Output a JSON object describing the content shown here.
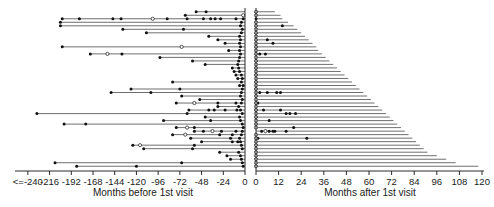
{
  "chart_data": {
    "type": "scatter",
    "title": "",
    "subtitle": "",
    "xlabel_left": "Months before 1st visit",
    "xlabel_right": "Months after 1st visit",
    "ylabel": "",
    "grid": false,
    "legend": null,
    "panels": [
      {
        "name": "before",
        "xlim": [
          -252,
          0
        ],
        "ticks": [
          -240,
          -216,
          -192,
          -168,
          -144,
          -120,
          -96,
          -72,
          -48,
          -24,
          0
        ],
        "tick_labels": [
          "<=-240",
          "-216",
          "-192",
          "-168",
          "-144",
          "-120",
          "-96",
          "-72",
          "-48",
          "-24",
          "0"
        ],
        "axis_title": "Months before 1st visit"
      },
      {
        "name": "after",
        "xlim": [
          0,
          120
        ],
        "ticks": [
          0,
          12,
          24,
          36,
          48,
          60,
          72,
          84,
          96,
          108,
          120
        ],
        "tick_labels": [
          "0",
          "12",
          "24",
          "36",
          "48",
          "60",
          "72",
          "84",
          "96",
          "108",
          "120"
        ],
        "axis_title": "Months after 1st visit"
      }
    ],
    "marker_types": {
      "filled": "filled circle = recorded visit event",
      "open": "open circle = censored / partial event"
    },
    "rows": [
      {
        "id": 1,
        "before_start": -54,
        "before_events": [
          -54,
          -43
        ],
        "before_open": [],
        "after_end": 10,
        "after_events": [],
        "after_open": [
          0
        ]
      },
      {
        "id": 2,
        "before_start": -66,
        "before_events": [
          -66
        ],
        "before_open": [
          -2
        ],
        "after_end": 13,
        "after_events": [],
        "after_open": [
          0
        ]
      },
      {
        "id": 3,
        "before_start": -202,
        "before_events": [
          -202,
          -183,
          -146,
          -137,
          -86,
          -64,
          -46,
          -38,
          -33,
          -27,
          -10,
          -2
        ],
        "before_open": [
          -102
        ],
        "after_end": 14,
        "after_events": [
          0
        ],
        "after_open": []
      },
      {
        "id": 4,
        "before_start": -204,
        "before_events": [
          -204,
          -4
        ],
        "before_open": [],
        "after_end": 17,
        "after_events": [],
        "after_open": [
          0
        ]
      },
      {
        "id": 5,
        "before_start": -204,
        "before_events": [
          -204,
          -5
        ],
        "before_open": [],
        "after_end": 20,
        "after_events": [
          14
        ],
        "after_open": [
          0
        ]
      },
      {
        "id": 6,
        "before_start": -135,
        "before_events": [
          -135,
          -68,
          -3
        ],
        "before_open": [],
        "after_end": 22,
        "after_events": [],
        "after_open": [
          0
        ]
      },
      {
        "id": 7,
        "before_start": -109,
        "before_events": [
          -109,
          -4
        ],
        "before_open": [],
        "after_end": 24,
        "after_events": [],
        "after_open": [
          0
        ]
      },
      {
        "id": 8,
        "before_start": -40,
        "before_events": [
          -40,
          -6
        ],
        "before_open": [],
        "after_end": 26,
        "after_events": [],
        "after_open": [
          0
        ]
      },
      {
        "id": 9,
        "before_start": -30,
        "before_events": [
          -30,
          -5
        ],
        "before_open": [],
        "after_end": 28,
        "after_events": [
          6
        ],
        "after_open": [
          0
        ]
      },
      {
        "id": 10,
        "before_start": -22,
        "before_events": [
          -22,
          -6
        ],
        "before_open": [],
        "after_end": 30,
        "after_events": [
          9
        ],
        "after_open": [
          0
        ]
      },
      {
        "id": 11,
        "before_start": -202,
        "before_events": [
          -202,
          -5
        ],
        "before_open": [
          -70
        ],
        "after_end": 32,
        "after_events": [],
        "after_open": [
          0
        ]
      },
      {
        "id": 12,
        "before_start": -18,
        "before_events": [
          -18,
          -6
        ],
        "before_open": [],
        "after_end": 33,
        "after_events": [],
        "after_open": [
          0
        ]
      },
      {
        "id": 13,
        "before_start": -171,
        "before_events": [
          -171,
          -136,
          -5
        ],
        "before_open": [
          -152
        ],
        "after_end": 35,
        "after_events": [
          2,
          5
        ],
        "after_open": [
          0
        ]
      },
      {
        "id": 14,
        "before_start": -94,
        "before_events": [
          -94,
          -6
        ],
        "before_open": [],
        "after_end": 37,
        "after_events": [],
        "after_open": [
          0
        ]
      },
      {
        "id": 15,
        "before_start": -58,
        "before_events": [
          -58,
          -7
        ],
        "before_open": [],
        "after_end": 39,
        "after_events": [],
        "after_open": [
          0
        ]
      },
      {
        "id": 16,
        "before_start": -44,
        "before_events": [
          -44,
          -8
        ],
        "before_open": [],
        "after_end": 41,
        "after_events": [],
        "after_open": [
          0
        ]
      },
      {
        "id": 17,
        "before_start": -14,
        "before_events": [
          -14,
          -7
        ],
        "before_open": [],
        "after_end": 43,
        "after_events": [],
        "after_open": [
          0
        ]
      },
      {
        "id": 18,
        "before_start": -12,
        "before_events": [
          -12,
          -6
        ],
        "before_open": [],
        "after_end": 45,
        "after_events": [],
        "after_open": [
          0
        ]
      },
      {
        "id": 19,
        "before_start": -10,
        "before_events": [
          -10,
          -4
        ],
        "before_open": [],
        "after_end": 47,
        "after_events": [],
        "after_open": [
          0
        ]
      },
      {
        "id": 20,
        "before_start": -8,
        "before_events": [
          -8,
          -3
        ],
        "before_open": [],
        "after_end": 49,
        "after_events": [],
        "after_open": [
          0
        ]
      },
      {
        "id": 21,
        "before_start": -80,
        "before_events": [
          -80,
          -4
        ],
        "before_open": [],
        "after_end": 51,
        "after_events": [],
        "after_open": [
          0
        ]
      },
      {
        "id": 22,
        "before_start": -6,
        "before_events": [
          -6,
          -2
        ],
        "before_open": [],
        "after_end": 53,
        "after_events": [],
        "after_open": [
          0
        ]
      },
      {
        "id": 23,
        "before_start": -126,
        "before_events": [
          -126,
          -72,
          -3
        ],
        "before_open": [],
        "after_end": 55,
        "after_events": [],
        "after_open": [
          0
        ]
      },
      {
        "id": 24,
        "before_start": -148,
        "before_events": [
          -148,
          -104,
          -4
        ],
        "before_open": [],
        "after_end": 57,
        "after_events": [
          2,
          6,
          11,
          13
        ],
        "after_open": [
          0
        ]
      },
      {
        "id": 25,
        "before_start": -70,
        "before_events": [
          -70,
          -5
        ],
        "before_open": [],
        "after_end": 59,
        "after_events": [],
        "after_open": [
          0
        ]
      },
      {
        "id": 26,
        "before_start": -50,
        "before_events": [
          -50,
          -3
        ],
        "before_open": [],
        "after_end": 61,
        "after_events": [],
        "after_open": [
          0
        ]
      },
      {
        "id": 27,
        "before_start": -76,
        "before_events": [
          -76,
          -30,
          -10,
          -4
        ],
        "before_open": [
          -56
        ],
        "after_end": 63,
        "after_events": [
          1
        ],
        "after_open": [
          0
        ]
      },
      {
        "id": 28,
        "before_start": -30,
        "before_events": [
          -30,
          -7
        ],
        "before_open": [],
        "after_end": 65,
        "after_events": [],
        "after_open": [
          0
        ]
      },
      {
        "id": 29,
        "before_start": -62,
        "before_events": [
          -62,
          -40,
          -34,
          -22,
          -9,
          -5
        ],
        "before_open": [],
        "after_end": 67,
        "after_events": [
          4,
          13
        ],
        "after_open": [
          0
        ]
      },
      {
        "id": 30,
        "before_start": -230,
        "before_events": [
          -230,
          -64,
          -3
        ],
        "before_open": [],
        "after_end": 69,
        "after_events": [
          16,
          18,
          21
        ],
        "after_open": [
          0
        ]
      },
      {
        "id": 31,
        "before_start": -44,
        "before_events": [
          -44,
          -6
        ],
        "before_open": [],
        "after_end": 71,
        "after_events": [],
        "after_open": [
          0
        ]
      },
      {
        "id": 32,
        "before_start": -90,
        "before_events": [
          -90,
          -38,
          -5
        ],
        "before_open": [],
        "after_end": 73,
        "after_events": [
          7
        ],
        "after_open": [
          0
        ]
      },
      {
        "id": 33,
        "before_start": -200,
        "before_events": [
          -200,
          -176,
          -3
        ],
        "before_open": [],
        "after_end": 75,
        "after_events": [],
        "after_open": [
          0
        ]
      },
      {
        "id": 34,
        "before_start": -76,
        "before_events": [
          -76,
          -56,
          -2
        ],
        "before_open": [
          -64
        ],
        "after_end": 77,
        "after_events": [
          20
        ],
        "after_open": [
          0
        ]
      },
      {
        "id": 35,
        "before_start": -56,
        "before_events": [
          -56,
          -46,
          -26,
          -10,
          -3
        ],
        "before_open": [
          -36
        ],
        "after_end": 79,
        "after_events": [
          3,
          7,
          9,
          10,
          16
        ],
        "after_open": [
          5
        ]
      },
      {
        "id": 36,
        "before_start": -80,
        "before_events": [
          -80,
          -28,
          -14,
          -4
        ],
        "before_open": [
          -66
        ],
        "after_end": 81,
        "after_events": [],
        "after_open": [
          0
        ]
      },
      {
        "id": 37,
        "before_start": -60,
        "before_events": [
          -60,
          -16,
          -6
        ],
        "before_open": [],
        "after_end": 83,
        "after_events": [
          1,
          27
        ],
        "after_open": [
          0
        ]
      },
      {
        "id": 38,
        "before_start": -48,
        "before_events": [
          -48,
          -14,
          -8,
          -5
        ],
        "before_open": [],
        "after_end": 85,
        "after_events": [],
        "after_open": [
          0
        ]
      },
      {
        "id": 39,
        "before_start": -124,
        "before_events": [
          -124,
          -56,
          -4
        ],
        "before_open": [
          -116
        ],
        "after_end": 87,
        "after_events": [],
        "after_open": [
          0
        ]
      },
      {
        "id": 40,
        "before_start": -112,
        "before_events": [
          -112,
          -58,
          -3
        ],
        "before_open": [],
        "after_end": 89,
        "after_events": [],
        "after_open": [
          0
        ]
      },
      {
        "id": 41,
        "before_start": -28,
        "before_events": [
          -28,
          -7
        ],
        "before_open": [],
        "after_end": 91,
        "after_events": [],
        "after_open": [
          0
        ]
      },
      {
        "id": 42,
        "before_start": -20,
        "before_events": [
          -20,
          -5
        ],
        "before_open": [],
        "after_end": 96,
        "after_events": [],
        "after_open": [
          0
        ]
      },
      {
        "id": 43,
        "before_start": -16,
        "before_events": [
          -16,
          -4
        ],
        "before_open": [],
        "after_end": 101,
        "after_events": [],
        "after_open": [
          0
        ]
      },
      {
        "id": 44,
        "before_start": -210,
        "before_events": [
          -210,
          -70,
          -3
        ],
        "before_open": [],
        "after_end": 106,
        "after_events": [],
        "after_open": [
          0
        ]
      },
      {
        "id": 45,
        "before_start": -186,
        "before_events": [
          -186,
          -120,
          -2
        ],
        "before_open": [],
        "after_end": 118,
        "after_events": [],
        "after_open": [
          0
        ]
      }
    ]
  }
}
